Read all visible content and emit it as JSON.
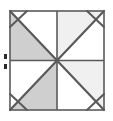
{
  "figure": {
    "name": "pinwheel-quilt-block",
    "canvas": {
      "width": 113,
      "height": 121,
      "background": "#ffffff"
    },
    "square": {
      "x": 10,
      "y": 11,
      "width": 94,
      "height": 99
    },
    "colors": {
      "stroke": "#5a5a5a",
      "fill_dark": "#cfcfcf",
      "fill_light": "#f0f0f0",
      "fill_none": "#ffffff",
      "marker": "#2b2b2b",
      "background": "#ffffff"
    },
    "stroke_widths": {
      "outer_border": 1.6,
      "midline": 1.6,
      "diagonal": 2.2,
      "corner_cut": 2.0
    },
    "center": {
      "x": 57,
      "y": 60.5
    },
    "triangles": [
      {
        "id": "tl-upper",
        "label": "top-left-upper",
        "fill": "#ffffff",
        "points": "10,11 57,11 10,60.5"
      },
      {
        "id": "tl-lower",
        "label": "top-left-lower",
        "fill": "#cfcfcf",
        "points": "10,11 57,60.5 10,60.5"
      },
      {
        "id": "tr-upper",
        "label": "top-right-upper",
        "fill": "#f0f0f0",
        "points": "57,11 104,11 57,60.5"
      },
      {
        "id": "tr-lower",
        "label": "top-right-lower",
        "fill": "#ffffff",
        "points": "104,11 104,60.5 57,60.5"
      },
      {
        "id": "bl-upper",
        "label": "bottom-left-upper",
        "fill": "#ffffff",
        "points": "10,60.5 57,60.5 10,110"
      },
      {
        "id": "bl-lower",
        "label": "bottom-left-lower",
        "fill": "#cfcfcf",
        "points": "57,60.5 57,110 10,110"
      },
      {
        "id": "br-upper",
        "label": "bottom-right-upper",
        "fill": "#f0f0f0",
        "points": "57,60.5 104,60.5 104,110"
      },
      {
        "id": "br-lower",
        "label": "bottom-right-lower",
        "fill": "#ffffff",
        "points": "57,60.5 104,110 57,110"
      }
    ],
    "midlines": [
      {
        "id": "horizontal-midline",
        "x1": 10,
        "y1": 60.5,
        "x2": 104,
        "y2": 60.5
      },
      {
        "id": "vertical-midline",
        "x1": 57,
        "y1": 11,
        "x2": 57,
        "y2": 110
      }
    ],
    "diagonals": [
      {
        "id": "diagonal-tl",
        "x1": 10,
        "y1": 11,
        "x2": 57,
        "y2": 60.5
      },
      {
        "id": "diagonal-tr",
        "x1": 104,
        "y1": 11,
        "x2": 57,
        "y2": 60.5
      },
      {
        "id": "diagonal-bl",
        "x1": 10,
        "y1": 110,
        "x2": 57,
        "y2": 60.5
      },
      {
        "id": "diagonal-br",
        "x1": 104,
        "y1": 110,
        "x2": 57,
        "y2": 60.5
      }
    ],
    "corner_cuts": [
      {
        "id": "corner-cut-top-left",
        "x1": 10,
        "y1": 27,
        "x2": 27,
        "y2": 11
      },
      {
        "id": "corner-cut-top-right",
        "x1": 87,
        "y1": 11,
        "x2": 104,
        "y2": 27
      },
      {
        "id": "corner-cut-bottom-left",
        "x1": 10,
        "y1": 94,
        "x2": 27,
        "y2": 110
      },
      {
        "id": "corner-cut-bottom-right",
        "x1": 87,
        "y1": 110,
        "x2": 104,
        "y2": 94
      }
    ],
    "edge_marker": {
      "id": "left-edge-marker",
      "x": 4,
      "y_top": 54,
      "y_bottom": 64,
      "width": 3,
      "height": 5,
      "color": "#2b2b2b"
    }
  }
}
